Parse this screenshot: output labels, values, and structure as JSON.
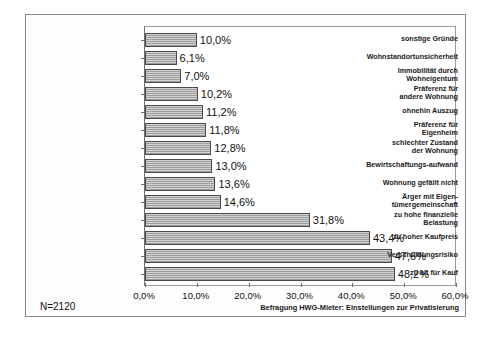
{
  "chart_data": {
    "type": "bar",
    "orientation": "horizontal",
    "title": "",
    "xlabel": "",
    "ylabel": "",
    "categories": [
      "sonstige Gründe",
      "Wohnstandortunsicherheit",
      "Immobilität durch Wohneigentum",
      "Präferenz für andere Wohnung",
      "ohnehin Auszug",
      "Präferenz für Eigenheim",
      "schlechter Zustand der Wohnung",
      "Bewirtschaftungs-aufwand",
      "Wohnung gefällt nicht",
      "Ärger mit Eigen- tümergemeinschaft",
      "zu hohe finanzielle Belastung",
      "zu hoher Kaufpreis",
      "Verschuldungsrisiko",
      "zu alt für Kauf"
    ],
    "category_lines": [
      [
        "sonstige Gründe"
      ],
      [
        "Wohnstandortunsicherheit"
      ],
      [
        "Immobilität durch",
        "Wohneigentum"
      ],
      [
        "Präferenz für",
        "andere Wohnung"
      ],
      [
        "ohnehin Auszug"
      ],
      [
        "Präferenz für",
        "Eigenheim"
      ],
      [
        "schlechter Zustand",
        "der Wohnung"
      ],
      [
        "Bewirtschaftungs-aufwand"
      ],
      [
        "Wohnung gefällt nicht"
      ],
      [
        "Ärger mit Eigen-",
        "tümergemeinschaft"
      ],
      [
        "zu hohe finanzielle",
        "Belastung"
      ],
      [
        "zu hoher Kaufpreis"
      ],
      [
        "Verschuldungsrisiko"
      ],
      [
        "zu alt für Kauf"
      ]
    ],
    "values": [
      10.0,
      6.1,
      7.0,
      10.2,
      11.2,
      11.8,
      12.8,
      13.0,
      13.6,
      14.6,
      31.8,
      43.4,
      47.6,
      48.2
    ],
    "value_labels": [
      "10,0%",
      "6,1%",
      "7,0%",
      "10,2%",
      "11,2%",
      "11,8%",
      "12,8%",
      "13,0%",
      "13,6%",
      "14,6%",
      "31,8%",
      "43,4%",
      "47,6%",
      "48,2%"
    ],
    "xlim": [
      0,
      60
    ],
    "xticks": [
      0,
      10,
      20,
      30,
      40,
      50,
      60
    ],
    "xtick_labels": [
      "0,0%",
      "10,0%",
      "20,0%",
      "30,0%",
      "40,0%",
      "50,0%",
      "60,0%"
    ],
    "grid": false,
    "legend": null,
    "bar_fill_color": "#b9b9b9",
    "bar_edge_color": "#4a4a4a"
  },
  "annotations": {
    "n_label": "N=2120",
    "footnote": "Befragung HWG-Mieter: Einstellungen zur Privatisierung"
  }
}
